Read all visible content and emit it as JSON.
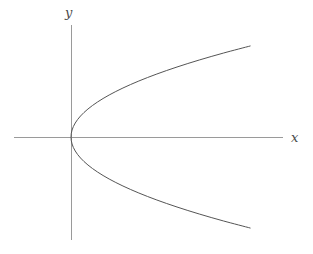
{
  "figure": {
    "width": 313,
    "height": 254,
    "background_color": "#ffffff"
  },
  "axes": {
    "x_axis_label": "x",
    "y_axis_label": "y",
    "axis_color": "#9a9a9a",
    "origin_px": {
      "x": 71,
      "y": 137
    },
    "x_axis_extent_px": {
      "start": 14,
      "end": 283
    },
    "y_axis_extent_px": {
      "start": 25,
      "end": 240
    }
  },
  "chart_data": {
    "type": "line",
    "title": "",
    "subtitle": "",
    "xlabel": "x",
    "ylabel": "y",
    "grid": false,
    "legend": [],
    "legend_position": "none",
    "axis_style": "two-crossing-axes-at-origin-no-ticks",
    "xlim": [
      -1.0,
      8.0
    ],
    "ylim": [
      -3.2,
      3.2
    ],
    "curve_color": "#555555",
    "curve_width": 1,
    "annotations": [],
    "tick_labels": {
      "x": [],
      "y": []
    },
    "series": [
      {
        "name": "parabola",
        "equation": "x = y^2",
        "orientation": "opens-right",
        "vertex": [
          0,
          0
        ],
        "x": [
          6.76,
          5.76,
          4.84,
          4.0,
          3.24,
          2.56,
          1.96,
          1.44,
          1.0,
          0.64,
          0.36,
          0.16,
          0.04,
          0.0,
          0.04,
          0.16,
          0.36,
          0.64,
          1.0,
          1.44,
          1.96,
          2.56,
          3.24,
          4.0,
          4.84,
          5.76,
          6.76
        ],
        "y": [
          2.6,
          2.4,
          2.2,
          2.0,
          1.8,
          1.6,
          1.4,
          1.2,
          1.0,
          0.8,
          0.6,
          0.4,
          0.2,
          0.0,
          -0.2,
          -0.4,
          -0.6,
          -0.8,
          -1.0,
          -1.2,
          -1.4,
          -1.6,
          -1.8,
          -2.0,
          -2.2,
          -2.4,
          -2.6
        ]
      }
    ]
  }
}
